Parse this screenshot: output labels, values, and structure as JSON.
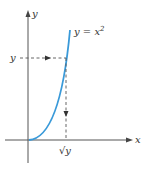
{
  "diagram": {
    "y_axis_label": "y",
    "x_axis_label": "x",
    "curve_label": "y = x",
    "curve_exponent": "2",
    "y_value_label": "y",
    "sqrt_label": "√y",
    "curve_color": "#3a9ad9",
    "axis_color": "#555555",
    "dash_color": "#555555"
  }
}
